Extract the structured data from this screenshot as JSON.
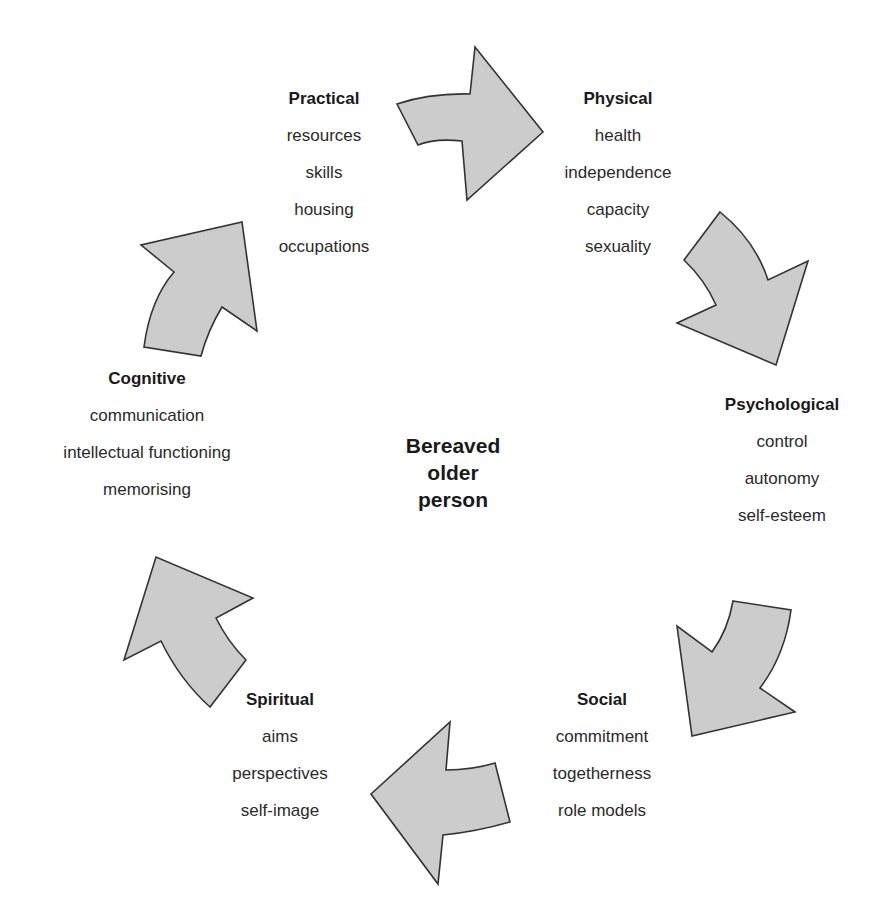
{
  "center": {
    "line1": "Bereaved",
    "line2": "older",
    "line3": "person"
  },
  "colors": {
    "arrow_fill": "#cccccc",
    "arrow_stroke": "#333333",
    "text": "#222222"
  },
  "groups": [
    {
      "id": "practical",
      "title": "Practical",
      "items": [
        "resources",
        "skills",
        "housing",
        "occupations"
      ]
    },
    {
      "id": "physical",
      "title": "Physical",
      "items": [
        "health",
        "independence",
        "capacity",
        "sexuality"
      ]
    },
    {
      "id": "psychological",
      "title": "Psychological",
      "items": [
        "control",
        "autonomy",
        "self-esteem"
      ]
    },
    {
      "id": "social",
      "title": "Social",
      "items": [
        "commitment",
        "togetherness",
        "role models"
      ]
    },
    {
      "id": "spiritual",
      "title": "Spiritual",
      "items": [
        "aims",
        "perspectives",
        "self-image"
      ]
    },
    {
      "id": "cognitive",
      "title": "Cognitive",
      "items": [
        "communication",
        "intellectual functioning",
        "memorising"
      ]
    }
  ],
  "arrows": [
    {
      "from": "Practical",
      "to": "Physical",
      "direction": "clockwise"
    },
    {
      "from": "Physical",
      "to": "Psychological",
      "direction": "clockwise"
    },
    {
      "from": "Psychological",
      "to": "Social",
      "direction": "clockwise"
    },
    {
      "from": "Social",
      "to": "Spiritual",
      "direction": "clockwise"
    },
    {
      "from": "Spiritual",
      "to": "Cognitive",
      "direction": "clockwise"
    },
    {
      "from": "Cognitive",
      "to": "Practical",
      "direction": "clockwise"
    }
  ]
}
